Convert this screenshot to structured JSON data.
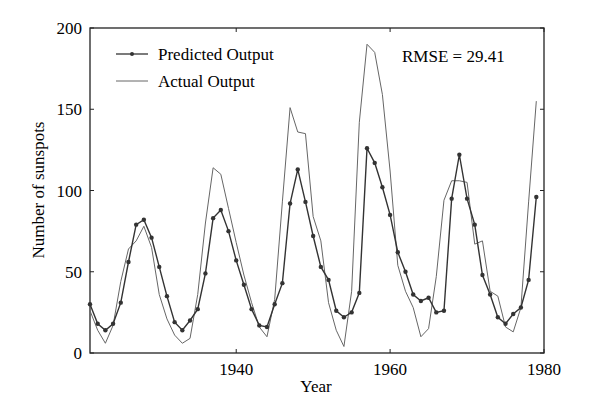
{
  "chart_data": {
    "type": "line",
    "title": "",
    "xlabel": "Year",
    "ylabel": "Number of sunspots",
    "xlim": [
      1921,
      1980
    ],
    "ylim": [
      0,
      200
    ],
    "xticks": [
      1940,
      1960,
      1980
    ],
    "yticks": [
      0,
      50,
      100,
      150,
      200
    ],
    "annotation": "RMSE = 29.41",
    "legend": [
      "Predicted Output",
      "Actual Output"
    ],
    "x": [
      1921,
      1922,
      1923,
      1924,
      1925,
      1926,
      1927,
      1928,
      1929,
      1930,
      1931,
      1932,
      1933,
      1934,
      1935,
      1936,
      1937,
      1938,
      1939,
      1940,
      1941,
      1942,
      1943,
      1944,
      1945,
      1946,
      1947,
      1948,
      1949,
      1950,
      1951,
      1952,
      1953,
      1954,
      1955,
      1956,
      1957,
      1958,
      1959,
      1960,
      1961,
      1962,
      1963,
      1964,
      1965,
      1966,
      1967,
      1968,
      1969,
      1970,
      1971,
      1972,
      1973,
      1974,
      1975,
      1976,
      1977,
      1978,
      1979
    ],
    "series": [
      {
        "name": "Actual Output",
        "values": [
          26,
          14,
          6,
          17,
          44,
          64,
          69,
          78,
          65,
          36,
          21,
          11,
          6,
          9,
          36,
          80,
          114,
          110,
          89,
          68,
          48,
          31,
          16,
          10,
          33,
          93,
          151,
          136,
          135,
          84,
          69,
          31,
          14,
          4,
          38,
          142,
          190,
          185,
          159,
          112,
          54,
          38,
          28,
          10,
          15,
          47,
          94,
          106,
          106,
          105,
          67,
          69,
          38,
          35,
          16,
          13,
          28,
          93,
          155
        ]
      },
      {
        "name": "Predicted Output",
        "values": [
          30,
          18,
          14,
          18,
          31,
          56,
          79,
          82,
          71,
          53,
          35,
          19,
          14,
          20,
          27,
          49,
          83,
          88,
          75,
          57,
          42,
          27,
          17,
          16,
          30,
          43,
          92,
          113,
          93,
          72,
          53,
          45,
          26,
          22,
          25,
          37,
          126,
          117,
          102,
          85,
          62,
          50,
          36,
          32,
          34,
          25,
          26,
          95,
          122,
          95,
          79,
          48,
          36,
          22,
          18,
          24,
          28,
          45,
          96
        ]
      }
    ]
  }
}
